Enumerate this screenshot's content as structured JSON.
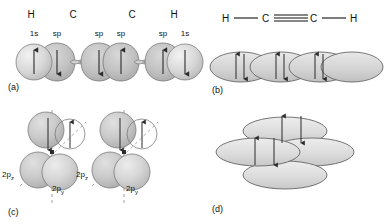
{
  "figure": {
    "panels": [
      {
        "id": "a",
        "label": "(a)"
      },
      {
        "id": "b",
        "label": "(b)"
      },
      {
        "id": "c",
        "label": "(c)"
      },
      {
        "id": "d",
        "label": "(d)"
      }
    ]
  },
  "panel_a": {
    "atom_labels": [
      {
        "text": "H",
        "x": 31
      },
      {
        "text": "C",
        "x": 73
      },
      {
        "text": "C",
        "x": 132
      },
      {
        "text": "H",
        "x": 174
      }
    ],
    "orbital_labels": [
      {
        "text": "1s",
        "x": 25
      },
      {
        "text": "sp",
        "x": 48
      },
      {
        "text": "sp",
        "x": 90
      },
      {
        "text": "sp",
        "x": 112
      },
      {
        "text": "sp",
        "x": 154
      },
      {
        "text": "1s",
        "x": 176
      }
    ],
    "orbitals": [
      {
        "type": "s",
        "arrow": "up",
        "cx": 34
      },
      {
        "type": "sp-right",
        "arrow": "down",
        "cx": 57
      },
      {
        "type": "sp-left",
        "arrow": "down",
        "cx": 99
      },
      {
        "type": "sp-right",
        "arrow": "up",
        "cx": 121
      },
      {
        "type": "sp-left",
        "arrow": "up",
        "cx": 163
      },
      {
        "type": "s",
        "arrow": "down",
        "cx": 185
      }
    ],
    "label": "(a)"
  },
  "panel_b": {
    "formula": {
      "atoms": [
        "H",
        "C",
        "C",
        "H"
      ],
      "bonds": [
        "single",
        "triple",
        "single"
      ],
      "text": "H—C≡C—H"
    },
    "lobes": [
      {
        "cx": 241,
        "arrows": "pair"
      },
      {
        "cx": 281,
        "arrows": "pair"
      },
      {
        "cx": 320,
        "arrows": "pair"
      },
      {
        "cx": 352,
        "arrows": "none"
      }
    ],
    "label": "(b)"
  },
  "panel_c": {
    "groups": [
      {
        "cx": 52,
        "labels": [
          {
            "text": "2p",
            "sub": "z",
            "x": 6,
            "y": 172
          },
          {
            "text": "2p",
            "sub": "y",
            "x": 56,
            "y": 186
          }
        ]
      },
      {
        "cx": 124,
        "labels": [
          {
            "text": "2p",
            "sub": "z",
            "x": 80,
            "y": 172
          },
          {
            "text": "2p",
            "sub": "y",
            "x": 130,
            "y": 186
          }
        ]
      }
    ],
    "label": "(c)"
  },
  "panel_d": {
    "lobes": [
      {
        "cx": 285,
        "cy": 131
      },
      {
        "cx": 258,
        "cy": 152
      },
      {
        "cx": 312,
        "cy": 152
      },
      {
        "cx": 285,
        "cy": 175
      }
    ],
    "arrow_pairs": [
      {
        "x": 282,
        "y": 122,
        "up_x": 278,
        "down_x": 297
      },
      {
        "x": 258,
        "y": 143,
        "up_x": 253,
        "down_x": 272
      }
    ],
    "label": "(d)"
  },
  "colors": {
    "orbital_fill": "#c9c9c9",
    "orbital_fill_light": "#e2e2e2",
    "orbital_stroke": "#6e6e6e",
    "arrow": "#2b2b2b",
    "text": "#111111",
    "axis_dash": "#8a8a8a"
  }
}
